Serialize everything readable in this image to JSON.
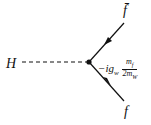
{
  "diagram": {
    "type": "feynman-vertex",
    "particles": {
      "scalar": "H",
      "antifermion": "f̄",
      "fermion": "f"
    },
    "vertex": {
      "prefix": "−ig",
      "subscript": "w",
      "fraction_numerator": "m",
      "numerator_subscript": "f",
      "fraction_denominator": "2m",
      "denominator_subscript": "W"
    },
    "colors": {
      "line": "#111111",
      "background": "#ffffff"
    }
  }
}
